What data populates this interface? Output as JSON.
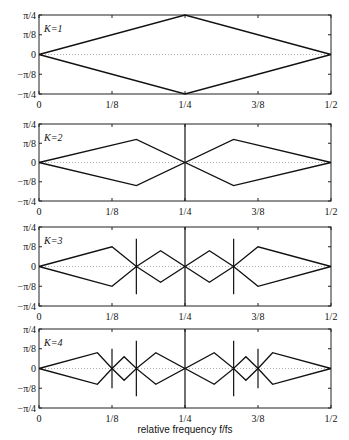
{
  "chart_data": [
    {
      "type": "line",
      "title": "K=1",
      "panel_label": "K=1",
      "xlabel": "",
      "ylabel": "",
      "xlim": [
        0,
        0.5
      ],
      "ylim": [
        -0.7854,
        0.7854
      ],
      "x_ticks": [
        "0",
        "1/8",
        "1/4",
        "3/8",
        "1/2"
      ],
      "y_ticks": [
        "π/4",
        "π/8",
        "0",
        "−π/8",
        "−π/4"
      ],
      "series": [
        {
          "name": "upper",
          "x": [
            0,
            0.25,
            0.5
          ],
          "y": [
            0,
            0.7854,
            0
          ]
        },
        {
          "name": "lower",
          "x": [
            0,
            0.25,
            0.5
          ],
          "y": [
            0,
            -0.7854,
            0
          ]
        }
      ],
      "vertical_lines": []
    },
    {
      "type": "line",
      "title": "K=2",
      "panel_label": "K=2",
      "xlabel": "",
      "ylabel": "",
      "xlim": [
        0,
        0.5
      ],
      "ylim": [
        -0.7854,
        0.7854
      ],
      "x_ticks": [
        "0",
        "1/8",
        "1/4",
        "3/8",
        "1/2"
      ],
      "y_ticks": [
        "π/4",
        "π/8",
        "0",
        "−π/8",
        "−π/4"
      ],
      "series": [
        {
          "name": "upper",
          "x": [
            0,
            0.1667,
            0.25,
            0.3333,
            0.5
          ],
          "y": [
            0,
            0.4712,
            0,
            0.4712,
            0
          ]
        },
        {
          "name": "lower",
          "x": [
            0,
            0.1667,
            0.25,
            0.3333,
            0.5
          ],
          "y": [
            0,
            -0.4712,
            0,
            -0.4712,
            0
          ]
        }
      ],
      "vertical_lines": [
        {
          "x": 0.25,
          "ymin": -0.7854,
          "ymax": 0.7854
        }
      ]
    },
    {
      "type": "line",
      "title": "K=3",
      "panel_label": "K=3",
      "xlabel": "",
      "ylabel": "",
      "xlim": [
        0,
        0.5
      ],
      "ylim": [
        -0.7854,
        0.7854
      ],
      "x_ticks": [
        "0",
        "1/8",
        "1/4",
        "3/8",
        "1/2"
      ],
      "y_ticks": [
        "π/4",
        "π/8",
        "0",
        "−π/8",
        "−π/4"
      ],
      "series": [
        {
          "name": "upper",
          "x": [
            0,
            0.125,
            0.1667,
            0.2083,
            0.25,
            0.2917,
            0.3333,
            0.375,
            0.5
          ],
          "y": [
            0,
            0.3927,
            0,
            0.3142,
            0,
            0.3142,
            0,
            0.3927,
            0
          ]
        },
        {
          "name": "lower",
          "x": [
            0,
            0.125,
            0.1667,
            0.2083,
            0.25,
            0.2917,
            0.3333,
            0.375,
            0.5
          ],
          "y": [
            0,
            -0.3927,
            0,
            -0.3142,
            0,
            -0.3142,
            0,
            -0.3927,
            0
          ]
        }
      ],
      "vertical_lines": [
        {
          "x": 0.1667,
          "ymin": -0.5498,
          "ymax": 0.5498
        },
        {
          "x": 0.25,
          "ymin": -0.7854,
          "ymax": 0.7854
        },
        {
          "x": 0.3333,
          "ymin": -0.5498,
          "ymax": 0.5498
        }
      ]
    },
    {
      "type": "line",
      "title": "K=4",
      "panel_label": "K=4",
      "xlabel": "relative frequency f/fs",
      "ylabel": "",
      "xlim": [
        0,
        0.5
      ],
      "ylim": [
        -0.7854,
        0.7854
      ],
      "x_ticks": [
        "0",
        "1/8",
        "1/4",
        "3/8",
        "1/2"
      ],
      "y_ticks": [
        "π/4",
        "π/8",
        "0",
        "−π/8",
        "−π/4"
      ],
      "series": [
        {
          "name": "upper",
          "x": [
            0,
            0.1,
            0.125,
            0.1458,
            0.1667,
            0.2,
            0.25,
            0.3,
            0.3333,
            0.3542,
            0.375,
            0.4,
            0.5
          ],
          "y": [
            0,
            0.3142,
            0,
            0.2356,
            0,
            0.3142,
            0,
            0.3142,
            0,
            0.2356,
            0,
            0.3142,
            0
          ]
        },
        {
          "name": "lower",
          "x": [
            0,
            0.1,
            0.125,
            0.1458,
            0.1667,
            0.2,
            0.25,
            0.3,
            0.3333,
            0.3542,
            0.375,
            0.4,
            0.5
          ],
          "y": [
            0,
            -0.3142,
            0,
            -0.2356,
            0,
            -0.3142,
            0,
            -0.3142,
            0,
            -0.2356,
            0,
            -0.3142,
            0
          ]
        }
      ],
      "vertical_lines": [
        {
          "x": 0.125,
          "ymin": -0.3927,
          "ymax": 0.3927
        },
        {
          "x": 0.1667,
          "ymin": -0.5498,
          "ymax": 0.5498
        },
        {
          "x": 0.25,
          "ymin": -0.7854,
          "ymax": 0.7854
        },
        {
          "x": 0.3333,
          "ymin": -0.5498,
          "ymax": 0.5498
        },
        {
          "x": 0.375,
          "ymin": -0.3927,
          "ymax": 0.3927
        }
      ]
    }
  ],
  "figure": {
    "xlabel": "relative frequency f/fs"
  }
}
